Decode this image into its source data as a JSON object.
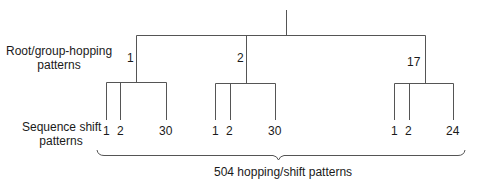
{
  "labels": {
    "root_group_line1": "Root/group-hopping",
    "root_group_line2": "patterns",
    "sequence_line1": "Sequence shift",
    "sequence_line2": "patterns",
    "total": "504 hopping/shift patterns"
  },
  "groups": [
    {
      "label": "1",
      "leaves": [
        "1",
        "2",
        "30"
      ]
    },
    {
      "label": "2",
      "leaves": [
        "1",
        "2",
        "30"
      ]
    },
    {
      "label": "17",
      "leaves": [
        "1",
        "2",
        "24"
      ]
    }
  ],
  "colors": {
    "line": "#555555",
    "text": "#1a1a1a"
  }
}
